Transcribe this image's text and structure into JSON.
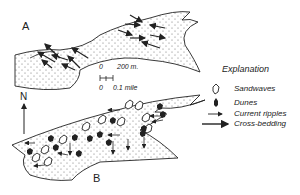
{
  "panels": [
    {
      "label": "A"
    },
    {
      "label": "B"
    }
  ],
  "north_arrow": {
    "label": "N"
  },
  "scale_bar": {
    "metric_start": "0",
    "metric_end": "200 m.",
    "imperial_start": "0",
    "imperial_end": "0.1 mile"
  },
  "legend": {
    "title": "Explanation",
    "items": [
      {
        "symbol": "sandwave-icon",
        "label": "Sandwaves"
      },
      {
        "symbol": "dune-icon",
        "label": "Dunes"
      },
      {
        "symbol": "short-arrow-icon",
        "label": "Current ripples"
      },
      {
        "symbol": "long-arrow-icon",
        "label": "Cross-bedding"
      }
    ]
  },
  "colors": {
    "ink": "#222222",
    "stipple": "#555555",
    "background": "#ffffff"
  }
}
